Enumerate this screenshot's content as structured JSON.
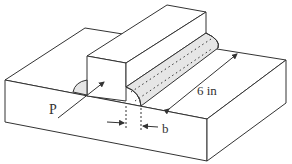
{
  "diagram": {
    "labels": {
      "force": "P",
      "length": "6 in",
      "weld_size": "b"
    },
    "colors": {
      "line": "#333333",
      "weld_fill": "#e6e6e6",
      "background": "#ffffff"
    }
  }
}
